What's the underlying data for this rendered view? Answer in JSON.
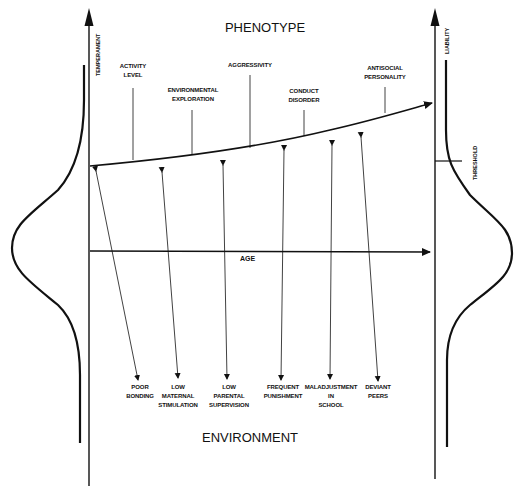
{
  "diagram": {
    "title_top": "PHENOTYPE",
    "title_bottom": "ENVIRONMENT",
    "left_axis_label": "TEMPERAMENT",
    "right_axis_label": "LIABILITY",
    "threshold_label": "THRESHOLD",
    "age_label": "AGE",
    "phenotype_labels": [
      {
        "lines": [
          "ACTIVITY",
          "LEVEL"
        ]
      },
      {
        "lines": [
          "ENVIRONMENTAL",
          "EXPLORATION"
        ]
      },
      {
        "lines": [
          "AGGRESSIVITY"
        ]
      },
      {
        "lines": [
          "CONDUCT",
          "DISORDER"
        ]
      },
      {
        "lines": [
          "ANTISOCIAL",
          "PERSONALITY"
        ]
      }
    ],
    "environment_labels": [
      {
        "lines": [
          "POOR",
          "BONDING"
        ]
      },
      {
        "lines": [
          "LOW",
          "MATERNAL",
          "STIMULATION"
        ]
      },
      {
        "lines": [
          "LOW",
          "PARENTAL",
          "SUPERVISION"
        ]
      },
      {
        "lines": [
          "FREQUENT",
          "PUNISHMENT"
        ]
      },
      {
        "lines": [
          "MALADJUSTMENT",
          "IN",
          "SCHOOL"
        ]
      },
      {
        "lines": [
          "DEVIANT",
          "PEERS"
        ]
      }
    ],
    "colors": {
      "ink": "#111111",
      "background": "#ffffff"
    }
  }
}
